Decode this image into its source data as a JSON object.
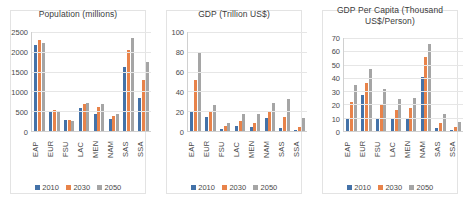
{
  "colors": {
    "series_2010": "#4472a8",
    "series_2030": "#e8834a",
    "series_2050": "#a5a5a5",
    "panel_background": "#ffffff",
    "gridline": "#e6e6e6",
    "axis_text": "#4a4a4a"
  },
  "legend": {
    "entries": [
      {
        "label": "2010",
        "color": "#4472a8"
      },
      {
        "label": "2030",
        "color": "#e8834a"
      },
      {
        "label": "2050",
        "color": "#a5a5a5"
      }
    ]
  },
  "chart_data": [
    {
      "type": "bar",
      "title": "Population (millions)",
      "title_line1": "Population (millions)",
      "title_line2": "",
      "xlabel": "",
      "ylabel": "",
      "ylim": [
        0,
        2500
      ],
      "yticks": [
        0,
        500,
        1000,
        1500,
        2000,
        2500
      ],
      "ytick_labels": [
        "0",
        "500",
        "1000",
        "1500",
        "2000",
        "2500"
      ],
      "grid": true,
      "legend_position": "bottom",
      "categories": [
        "EAP",
        "EUR",
        "FSU",
        "LAC",
        "MEN",
        "NAM",
        "SAS",
        "SSA"
      ],
      "series": [
        {
          "name": "2010",
          "values": [
            2160,
            500,
            280,
            570,
            440,
            310,
            1610,
            840
          ]
        },
        {
          "name": "2030",
          "values": [
            2310,
            520,
            275,
            690,
            600,
            380,
            2050,
            1300
          ]
        },
        {
          "name": "2050",
          "values": [
            2230,
            510,
            250,
            720,
            680,
            430,
            2340,
            1750
          ]
        }
      ]
    },
    {
      "type": "bar",
      "title": "GDP (Trillion US$)",
      "title_line1": "GDP (Trillion US$)",
      "title_line2": "",
      "xlabel": "",
      "ylabel": "",
      "ylim": [
        0,
        100
      ],
      "yticks": [
        0,
        20,
        40,
        60,
        80,
        100
      ],
      "ytick_labels": [
        "0",
        "20",
        "40",
        "60",
        "80",
        "100"
      ],
      "grid": true,
      "legend_position": "bottom",
      "categories": [
        "EAP",
        "EUR",
        "FSU",
        "LAC",
        "MEN",
        "NAM",
        "SAS",
        "SSA"
      ],
      "series": [
        {
          "name": "2010",
          "values": [
            19,
            14,
            2,
            5,
            4,
            13,
            3,
            1
          ]
        },
        {
          "name": "2030",
          "values": [
            52,
            19,
            5,
            10,
            8,
            20,
            14,
            4
          ]
        },
        {
          "name": "2050",
          "values": [
            80,
            26,
            8,
            17,
            17,
            28,
            32,
            13
          ]
        }
      ]
    },
    {
      "type": "bar",
      "title": "GDP Per Capita (Thousand US$/Person)",
      "title_line1": "GDP Per Capita (Thousand",
      "title_line2": "US$/Person)",
      "xlabel": "",
      "ylabel": "",
      "ylim": [
        0,
        70
      ],
      "yticks": [
        0,
        10,
        20,
        30,
        40,
        50,
        60,
        70
      ],
      "ytick_labels": [
        "0",
        "10",
        "20",
        "30",
        "40",
        "50",
        "60",
        "70"
      ],
      "grid": true,
      "legend_position": "bottom",
      "categories": [
        "EAP",
        "EUR",
        "FSU",
        "LAC",
        "MEN",
        "NAM",
        "SAS",
        "SSA"
      ],
      "series": [
        {
          "name": "2010",
          "values": [
            9,
            27,
            9.5,
            9.5,
            9.5,
            40.5,
            2,
            1
          ]
        },
        {
          "name": "2030",
          "values": [
            22,
            36,
            20.5,
            16,
            17,
            56,
            6,
            3
          ]
        },
        {
          "name": "2050",
          "values": [
            35,
            47,
            31.5,
            24,
            25,
            65.5,
            12.5,
            7
          ]
        }
      ]
    }
  ]
}
